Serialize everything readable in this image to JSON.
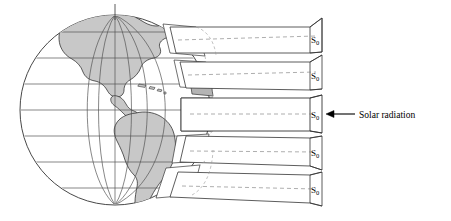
{
  "figure": {
    "background_color": "#ffffff",
    "line_color": "#1a1a1a",
    "land_fill": "#c8c8c8",
    "beam_fill": "#ffffff",
    "footprint_shaded_fill": "#b4b4b4"
  },
  "globe": {
    "name": "earth-globe",
    "center_x": 115,
    "center_y": 110,
    "radius": 95,
    "graticule": {
      "latitude_count": 7,
      "longitude_count": 5,
      "line_color": "#555555"
    },
    "landmass_label": "Americas"
  },
  "beams": [
    {
      "id": "beam-north-high",
      "label": "S",
      "subscript": "0",
      "latitude_band": "high-north",
      "center_y": 40,
      "half_height": 13,
      "relative_intensity": "oblique"
    },
    {
      "id": "beam-north-mid",
      "label": "S",
      "subscript": "0",
      "latitude_band": "mid-north",
      "center_y": 75,
      "half_height": 14,
      "relative_intensity": "oblique"
    },
    {
      "id": "beam-equatorial",
      "label": "S",
      "subscript": "0",
      "latitude_band": "equator",
      "center_y": 114,
      "half_height": 16,
      "relative_intensity": "direct"
    },
    {
      "id": "beam-south-mid",
      "label": "S",
      "subscript": "0",
      "latitude_band": "mid-south",
      "center_y": 152,
      "half_height": 14,
      "relative_intensity": "oblique"
    },
    {
      "id": "beam-south-high",
      "label": "S",
      "subscript": "0",
      "latitude_band": "high-south",
      "center_y": 188,
      "half_height": 13,
      "relative_intensity": "oblique"
    }
  ],
  "annotation": {
    "name": "solar-radiation-callout",
    "text": "Solar radiation",
    "arrow_direction": "left",
    "arrow_tip_x": 318,
    "arrow_y": 114,
    "text_x": 359
  }
}
